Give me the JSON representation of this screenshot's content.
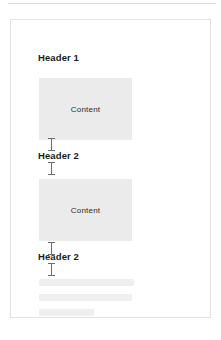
{
  "document": {
    "sections": [
      {
        "heading": "Header 1",
        "level": 1,
        "content_label": "Content"
      },
      {
        "heading": "Header 2",
        "level": 2,
        "content_label": "Content"
      },
      {
        "heading": "Header 2",
        "level": 2,
        "content_label": ""
      }
    ],
    "headings": {
      "first": "Header 1",
      "second": "Header 2",
      "third": "Header 2"
    },
    "content_blocks": {
      "first_label": "Content",
      "second_label": "Content"
    },
    "placeholder_lines": [
      "",
      "",
      ""
    ],
    "carets": {
      "count": 4,
      "icon": "text-caret-icon"
    }
  },
  "colors": {
    "page_background": "#ffffff",
    "page_border": "#e2e2e4",
    "top_rule": "#d9d9dc",
    "content_block_fill": "#ebebeb",
    "heading_text": "#1b1b1b",
    "content_text": "#2b2b2b",
    "caret": "#6d6d6d",
    "skeleton_line": "#efeff0"
  }
}
